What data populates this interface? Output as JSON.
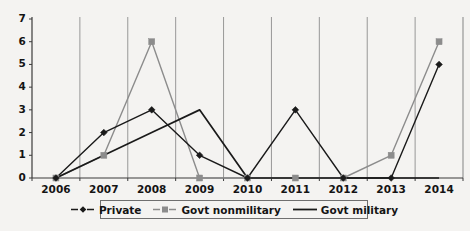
{
  "chart_data": {
    "type": "line",
    "title": "",
    "subtitle": "",
    "xlabel": "",
    "ylabel": "",
    "categories": [
      "2006",
      "2007",
      "2008",
      "2009",
      "2010",
      "2011",
      "2012",
      "2013",
      "2014"
    ],
    "yticks": [
      0,
      1,
      2,
      3,
      4,
      5,
      6,
      7
    ],
    "ylim": [
      0,
      7
    ],
    "grid": "vertical-only",
    "legend_position": "bottom",
    "series": [
      {
        "name": "Private",
        "color": "#1a1a1a",
        "marker": "diamond",
        "values": [
          0,
          2,
          3,
          1,
          0,
          3,
          0,
          0,
          5
        ]
      },
      {
        "name": "Govt nonmilitary",
        "color": "#8c8c8c",
        "marker": "square",
        "values": [
          0,
          1,
          6,
          0,
          0,
          0,
          0,
          1,
          6
        ]
      },
      {
        "name": "Govt military",
        "color": "#1a1a1a",
        "marker": "none",
        "values": [
          0,
          1,
          2,
          3,
          0,
          0,
          0,
          0,
          0
        ]
      }
    ]
  },
  "axes": {
    "y_tick_labels": [
      "7",
      "6",
      "5",
      "4",
      "3",
      "2",
      "1",
      "0"
    ],
    "x_tick_labels": [
      "2006",
      "2007",
      "2008",
      "2009",
      "2010",
      "2011",
      "2012",
      "2013",
      "2014"
    ]
  },
  "legend": {
    "items": [
      {
        "label": "Private",
        "marker": "diamond",
        "color": "#1a1a1a"
      },
      {
        "label": "Govt nonmilitary",
        "marker": "square",
        "color": "#8c8c8c"
      },
      {
        "label": "Govt military",
        "marker": "none",
        "color": "#1a1a1a"
      }
    ]
  },
  "colors": {
    "background": "#f4f3f1",
    "axis": "#3b3b3b",
    "gridline": "#8d8d8d",
    "private": "#1a1a1a",
    "govt_nonmilitary": "#8c8c8c",
    "govt_military": "#1a1a1a"
  }
}
